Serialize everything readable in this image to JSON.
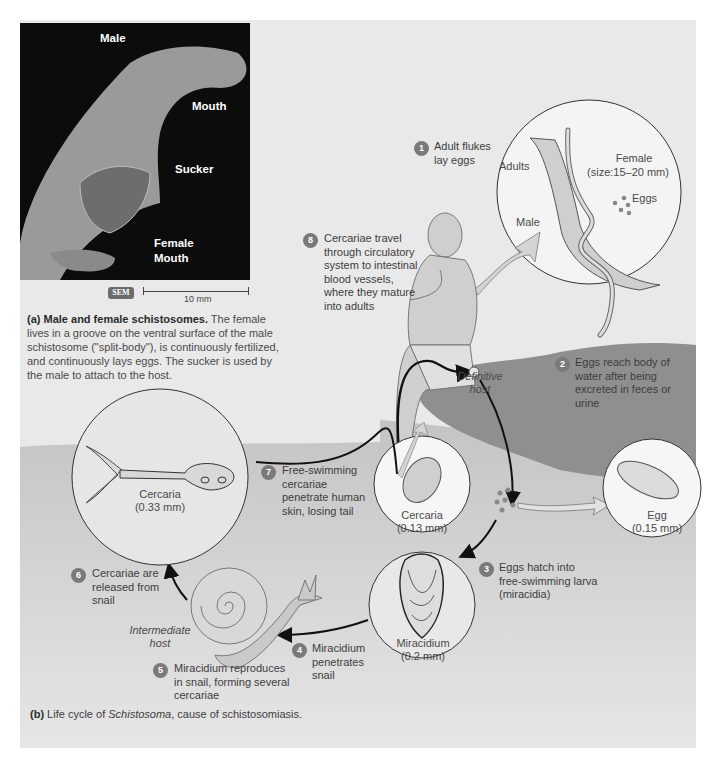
{
  "panel_a": {
    "sem_labels": {
      "male": "Male",
      "mouth_male": "Mouth",
      "sucker": "Sucker",
      "female": "Female",
      "mouth_female": "Mouth"
    },
    "sem_badge": "SEM",
    "scale_bar": "10 mm",
    "caption_title": "(a) Male and female schistosomes.",
    "caption_body": "The female lives in a groove on the ventral surface of the male schistosome (\"split-body\"), is continuously fertilized, and continuously lays eggs.  The sucker is used by the male to attach to the host."
  },
  "panel_b": {
    "steps": [
      {
        "n": "1",
        "text": "Adult flukes lay eggs"
      },
      {
        "n": "2",
        "text": "Eggs reach body of water after being excreted in feces or urine"
      },
      {
        "n": "3",
        "text": "Eggs hatch into free-swimming larva (miracidia)"
      },
      {
        "n": "4",
        "text": "Miracidium penetrates snail"
      },
      {
        "n": "5",
        "text": "Miracidium reproduces in snail, forming several cercariae"
      },
      {
        "n": "6",
        "text": "Cercariae are released from snail"
      },
      {
        "n": "7",
        "text": "Free-swimming cercariae penetrate human skin, losing tail"
      },
      {
        "n": "8",
        "text": "Cercariae travel through circulatory system to intestinal blood vessels, where they mature into adults"
      }
    ],
    "adults_circle": {
      "adults": "Adults",
      "female": "Female",
      "female_size": "(size:15–20 mm)",
      "eggs": "Eggs",
      "male": "Male"
    },
    "cercaria_large": {
      "name": "Cercaria",
      "size": "(0.33 mm)"
    },
    "cercaria_small": {
      "name": "Cercaria",
      "size": "(0.13 mm)"
    },
    "egg": {
      "name": "Egg",
      "size": "(0.15 mm)"
    },
    "miracidium": {
      "name": "Miracidium",
      "size": "(0.2 mm)"
    },
    "definitive_host": "Definitive host",
    "intermediate_host": "Intermediate host",
    "caption_label": "(b)",
    "caption_pre": "Life cycle of ",
    "caption_genus": "Schistosoma",
    "caption_post": ", cause of schistosomiasis."
  },
  "colors": {
    "panel_bg": "#e9e9e9",
    "water": "#c9c9c9",
    "rock": "#8f8f8f",
    "badge": "#7a7a7a",
    "figure_fill": "#cfcfcf"
  }
}
